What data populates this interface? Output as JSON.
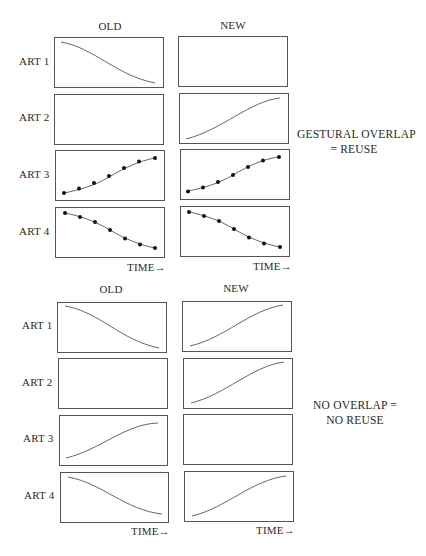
{
  "panels": [
    {
      "name": "gestural-overlap",
      "column_headers": [
        "OLD",
        "NEW"
      ],
      "row_labels": [
        "ART 1",
        "ART 2",
        "ART 3",
        "ART 4"
      ],
      "time_label": "TIME→",
      "note_line1": "GESTURAL  OVERLAP",
      "note_line2": "= REUSE",
      "cells": [
        {
          "row": "ART 1",
          "old": "falling",
          "new": "empty"
        },
        {
          "row": "ART 2",
          "old": "empty",
          "new": "rising"
        },
        {
          "row": "ART 3",
          "old": "rising-dotted",
          "new": "rising-dotted"
        },
        {
          "row": "ART 4",
          "old": "falling-dotted",
          "new": "falling-dotted"
        }
      ]
    },
    {
      "name": "no-overlap",
      "column_headers": [
        "OLD",
        "NEW"
      ],
      "row_labels": [
        "ART 1",
        "ART 2",
        "ART 3",
        "ART 4"
      ],
      "time_label": "TIME→",
      "note_line1": "NO OVERLAP =",
      "note_line2": "NO REUSE",
      "cells": [
        {
          "row": "ART 1",
          "old": "falling",
          "new": "rising"
        },
        {
          "row": "ART 2",
          "old": "empty",
          "new": "rising"
        },
        {
          "row": "ART 3",
          "old": "rising",
          "new": "empty"
        },
        {
          "row": "ART 4",
          "old": "falling",
          "new": "rising"
        }
      ]
    }
  ],
  "colors": {
    "stroke": "#555555",
    "curve": "#666666",
    "dot": "#111111",
    "text": "#2a2a2a"
  }
}
